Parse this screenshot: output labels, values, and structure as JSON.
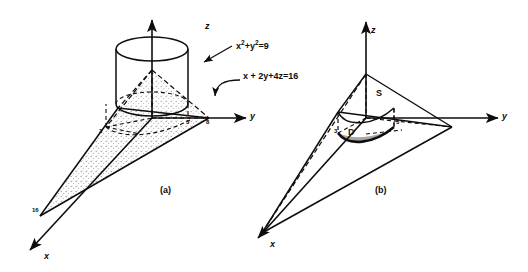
{
  "figure": {
    "title": "",
    "background": "#ffffff",
    "ink": "#0d0d0d",
    "shade": "#b8b4ae",
    "panels": [
      {
        "id": "a",
        "caption": "(a)",
        "axes": {
          "z": "z",
          "y": "y",
          "x": "x"
        },
        "annotations": [
          {
            "name": "cylinder-equation",
            "text": "x2+y2=9",
            "base": "x",
            "sup1": "2",
            "mid": "+y",
            "sup2": "2",
            "tail": "=9"
          },
          {
            "name": "plane-equation",
            "text": "x + 2y+4z=16"
          }
        ],
        "ticks": [
          {
            "name": "tick-x-16",
            "label": "16"
          },
          {
            "name": "tick-y-8",
            "label": "8"
          },
          {
            "name": "tick-y-3",
            "label": "3"
          },
          {
            "name": "tick-x-3",
            "label": "3"
          }
        ]
      },
      {
        "id": "b",
        "caption": "(b)",
        "axes": {
          "z": "z",
          "y": "y",
          "x": "x"
        },
        "regions": [
          {
            "name": "surface-label",
            "label": "S"
          },
          {
            "name": "domain-label",
            "label": "D"
          }
        ],
        "ticks": [
          {
            "name": "tick-y-3",
            "label": "3"
          },
          {
            "name": "tick-x-3",
            "label": "3"
          }
        ]
      }
    ]
  }
}
